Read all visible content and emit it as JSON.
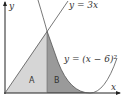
{
  "diagram": {
    "axes": {
      "x_label": "x",
      "y_label": "y"
    },
    "curves": [
      {
        "id": "line",
        "label": "y = 3x",
        "equation": "y = 3x"
      },
      {
        "id": "parabola",
        "label": "y = (x − 6)²",
        "equation": "y = (x - 6)^2"
      }
    ],
    "regions": [
      {
        "id": "A",
        "label": "A",
        "fill": "#d6d6d6"
      },
      {
        "id": "B",
        "label": "B",
        "fill": "#9a9a9a"
      }
    ],
    "colors": {
      "axis": "#222222",
      "curve": "#555555",
      "region_a": "#d6d6d6",
      "region_b": "#9a9a9a"
    }
  }
}
